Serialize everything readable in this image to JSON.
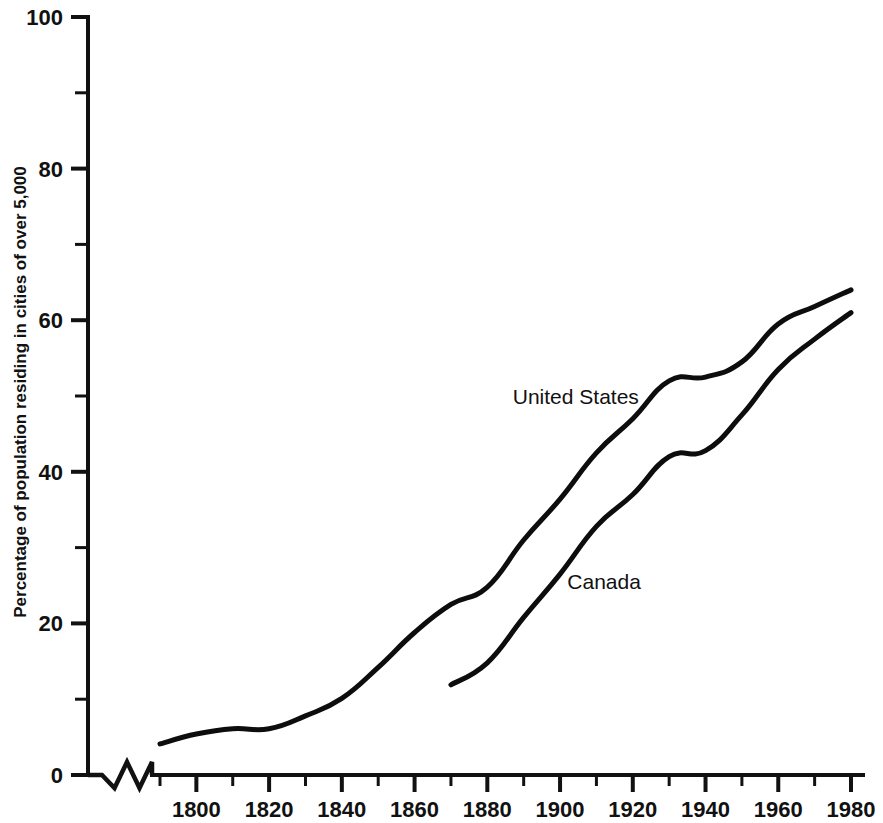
{
  "chart_data": {
    "type": "line",
    "title": "",
    "subtitle": "",
    "xlabel": "",
    "ylabel": "Percentage of population residing in cities of over 5,000",
    "xlim": [
      1786,
      1980
    ],
    "ylim": [
      0,
      100
    ],
    "grid": false,
    "legend_position": "inline-annotation",
    "x_major_ticks": [
      1800,
      1820,
      1840,
      1860,
      1880,
      1900,
      1920,
      1940,
      1960,
      1980
    ],
    "x_major_tick_labels": [
      "1800",
      "1820",
      "1840",
      "1860",
      "1880",
      "1900",
      "1920",
      "1940",
      "1960",
      "1980"
    ],
    "x_minor_ticks": [
      1790,
      1810,
      1830,
      1850,
      1870,
      1890,
      1910,
      1930,
      1950,
      1970
    ],
    "y_major_ticks": [
      0,
      20,
      40,
      60,
      80,
      100
    ],
    "y_major_tick_labels": [
      "0",
      "20",
      "40",
      "60",
      "80",
      "100"
    ],
    "y_minor_ticks": [
      10,
      30,
      50,
      70,
      90
    ],
    "axis_break": {
      "present": true,
      "axis": "x",
      "style": "zigzag",
      "note": "broken x-axis between origin and 1790"
    },
    "series": [
      {
        "name": "United States",
        "label": "United States",
        "label_x": 1887,
        "label_y": 49,
        "x": [
          1790,
          1800,
          1810,
          1820,
          1830,
          1840,
          1850,
          1860,
          1870,
          1880,
          1890,
          1900,
          1910,
          1920,
          1930,
          1940,
          1950,
          1960,
          1970,
          1980
        ],
        "values": [
          4.1,
          5.4,
          6.1,
          6.1,
          7.8,
          10.1,
          14.2,
          18.8,
          22.5,
          24.8,
          31.0,
          36.4,
          42.5,
          47.0,
          52.0,
          52.5,
          54.5,
          59.5,
          61.8,
          64.0
        ]
      },
      {
        "name": "Canada",
        "label": "Canada",
        "label_x": 1902,
        "label_y": 24.5,
        "x": [
          1870,
          1880,
          1890,
          1900,
          1910,
          1920,
          1930,
          1940,
          1950,
          1960,
          1970,
          1980
        ],
        "values": [
          11.9,
          14.8,
          20.8,
          26.5,
          32.8,
          37.0,
          42.0,
          42.8,
          47.5,
          53.5,
          57.5,
          61.0
        ]
      }
    ]
  },
  "labels": {
    "y_axis_title": "Percentage of population residing in cities of over 5,000",
    "series_us": "United States",
    "series_canada": "Canada"
  }
}
